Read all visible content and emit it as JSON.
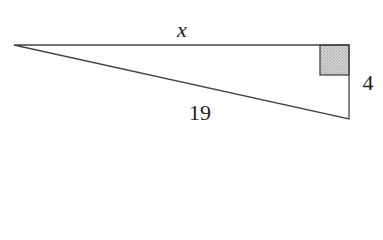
{
  "diagram": {
    "type": "right-triangle",
    "labels": {
      "top_side": "x",
      "right_side": "4",
      "hypotenuse": "19"
    },
    "vertices": {
      "left": [
        14,
        45
      ],
      "top_right": [
        349,
        45
      ],
      "bottom_right": [
        349,
        119
      ]
    },
    "right_angle_marker": {
      "fill": "#c8c8c8",
      "stroke": "#444444"
    },
    "line_color": "#444444"
  }
}
